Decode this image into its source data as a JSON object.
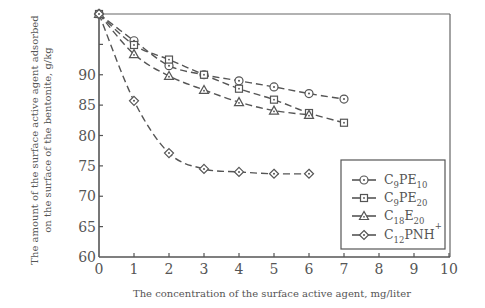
{
  "chart_data": {
    "type": "line",
    "title": "",
    "xlabel": "The concentration of the surface active agent, mg/liter",
    "ylabel_line1": "The amount of the surface active agent adsorbed",
    "ylabel_line2": "on the surface of the bentonite, g/kg",
    "xlim": [
      0,
      10
    ],
    "ylim": [
      60,
      100
    ],
    "x_ticks": [
      0,
      1,
      2,
      3,
      4,
      5,
      6,
      7,
      8,
      9,
      10
    ],
    "y_ticks": [
      60,
      65,
      70,
      75,
      80,
      85,
      90,
      95
    ],
    "y_tick_labels": [
      "60",
      "65",
      "70",
      "75",
      "80",
      "85",
      "90",
      ""
    ],
    "grid": false,
    "legend_position": "lower right",
    "series": [
      {
        "name": "C9PE10",
        "base": "C",
        "sub1": "9",
        "mid": "PE",
        "sub2": "10",
        "sup": "",
        "marker": "circle",
        "x": [
          0,
          1,
          2,
          3,
          4,
          5,
          6,
          7
        ],
        "values": [
          100,
          95.6,
          91.5,
          90.0,
          89.0,
          88.0,
          86.9,
          86.0
        ]
      },
      {
        "name": "C9PE20",
        "base": "C",
        "sub1": "9",
        "mid": "PE",
        "sub2": "20",
        "sup": "",
        "marker": "square",
        "x": [
          0,
          1,
          2,
          3,
          4,
          5,
          6,
          7
        ],
        "values": [
          100,
          94.9,
          92.5,
          90.0,
          87.7,
          85.9,
          83.7,
          82.1
        ]
      },
      {
        "name": "C18E20",
        "base": "C",
        "sub1": "18",
        "mid": "E",
        "sub2": "20",
        "sup": "",
        "marker": "triangle",
        "x": [
          0,
          1,
          2,
          3,
          4,
          5,
          6
        ],
        "values": [
          100,
          93.4,
          89.8,
          87.5,
          85.5,
          84.1,
          83.4
        ]
      },
      {
        "name": "C12PNH+",
        "base": "C",
        "sub1": "12",
        "mid": "PNH",
        "sub2": "",
        "sup": "+",
        "marker": "diamond",
        "x": [
          0,
          1,
          2,
          3,
          4,
          5,
          6
        ],
        "values": [
          100,
          85.7,
          77.1,
          74.5,
          74.0,
          73.7,
          73.7
        ]
      }
    ]
  },
  "colors": {
    "line": "#555555",
    "axis": "#555555",
    "text": "#555555",
    "background": "#ffffff"
  }
}
